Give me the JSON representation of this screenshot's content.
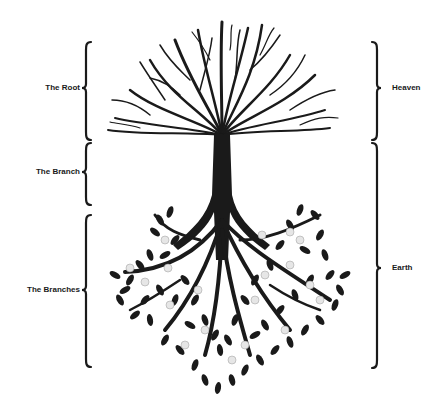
{
  "diagram": {
    "title": "",
    "colors": {
      "ink": "#1a1a1a",
      "fruit": "#e6e6e6",
      "background": "#ffffff"
    },
    "left_labels": [
      {
        "id": "root",
        "text": "The Root",
        "bracket_top": 42,
        "bracket_bottom": 140,
        "tip": 88
      },
      {
        "id": "branch",
        "text": "The Branch",
        "bracket_top": 143,
        "bracket_bottom": 205,
        "tip": 172
      },
      {
        "id": "branches",
        "text": "The Branches",
        "bracket_top": 215,
        "bracket_bottom": 367,
        "tip": 290
      }
    ],
    "right_labels": [
      {
        "id": "heaven",
        "text": "Heaven",
        "bracket_top": 42,
        "bracket_bottom": 140,
        "tip": 88
      },
      {
        "id": "earth",
        "text": "Earth",
        "bracket_top": 143,
        "bracket_bottom": 368,
        "tip": 268
      }
    ],
    "illustration": {
      "subject": "inverted tree",
      "top": "bare roots spreading upward",
      "middle": "single trunk",
      "bottom": "leafy branches with fruit"
    }
  }
}
